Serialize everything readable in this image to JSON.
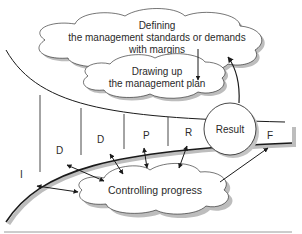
{
  "diagram": {
    "clouds": {
      "defining": {
        "line1": "Defining",
        "line2": "the management standards or demands",
        "line3": "with margins"
      },
      "drawing": {
        "line1": "Drawing up",
        "line2": "the management plan"
      },
      "controlling": {
        "label": "Controlling progress"
      }
    },
    "result_circle": {
      "label": "Result"
    },
    "phases": [
      "I",
      "D",
      "D",
      "P",
      "R",
      "F"
    ],
    "colors": {
      "line": "#1a1a1a",
      "shadow": "#b8b8b8",
      "fill": "#ffffff",
      "text": "#2a2a2a"
    }
  }
}
